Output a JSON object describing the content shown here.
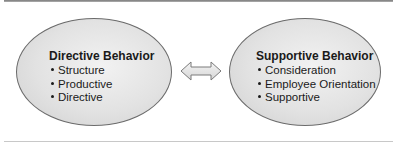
{
  "diagram": {
    "left": {
      "title": "Directive Behavior",
      "items": [
        "Structure",
        "Productive",
        "Directive"
      ]
    },
    "right": {
      "title": "Supportive Behavior",
      "items": [
        "Consideration",
        "Employee Orientation",
        "Supportive"
      ]
    },
    "connector": "double-headed-arrow"
  }
}
